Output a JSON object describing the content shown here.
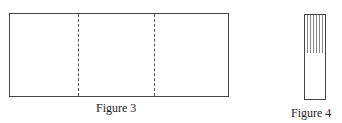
{
  "figures": [
    {
      "caption": "Figure 3",
      "shape": "rectangle",
      "divisions": 3,
      "divider_style": "dashed"
    },
    {
      "caption": "Figure 4",
      "shape": "tall narrow strip",
      "detail": "vertical lines in upper portion"
    }
  ]
}
